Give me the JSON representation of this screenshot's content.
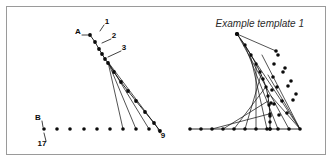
{
  "figure": {
    "background_color": "#ffffff",
    "ink_color": "#0b0b0b",
    "frame_color": "#9a9a9a",
    "width": 332,
    "height": 163
  },
  "caption": {
    "text": "Example template 1",
    "style": "italic"
  },
  "left_panel": {
    "title": "",
    "labels": [
      {
        "id": "A",
        "text": "A",
        "x": 78,
        "y": 32,
        "leader_to_x": 90,
        "leader_to_y": 35
      },
      {
        "id": "1",
        "text": "1",
        "x": 107,
        "y": 22,
        "leader_to_x": 100,
        "leader_to_y": 31
      },
      {
        "id": "2",
        "text": "2",
        "x": 114,
        "y": 36,
        "leader_to_x": 102,
        "leader_to_y": 43
      },
      {
        "id": "3",
        "text": "3",
        "x": 124,
        "y": 48,
        "leader_to_x": 108,
        "leader_to_y": 57
      },
      {
        "id": "9",
        "text": "9",
        "x": 163,
        "y": 136,
        "leader_to_x": 158,
        "leader_to_y": 130
      },
      {
        "id": "B",
        "text": "B",
        "x": 38,
        "y": 118,
        "leader_to_x": 43,
        "leader_to_y": 127
      },
      {
        "id": "17",
        "text": "17",
        "x": 42,
        "y": 144,
        "leader_to_x": 44,
        "leader_to_y": 133
      }
    ],
    "spine_points": [
      {
        "x": 90,
        "y": 35
      },
      {
        "x": 95,
        "y": 42
      },
      {
        "x": 99,
        "y": 49
      },
      {
        "x": 102,
        "y": 54
      },
      {
        "x": 105,
        "y": 59
      },
      {
        "x": 108,
        "y": 63
      },
      {
        "x": 114,
        "y": 72
      },
      {
        "x": 121,
        "y": 82
      },
      {
        "x": 128,
        "y": 91
      },
      {
        "x": 136,
        "y": 101
      },
      {
        "x": 145,
        "y": 112
      },
      {
        "x": 154,
        "y": 123
      },
      {
        "x": 160,
        "y": 131
      }
    ],
    "baseline_points": [
      {
        "x": 44,
        "y": 129
      },
      {
        "x": 57,
        "y": 129
      },
      {
        "x": 70,
        "y": 129
      },
      {
        "x": 84,
        "y": 129
      },
      {
        "x": 97,
        "y": 129
      },
      {
        "x": 110,
        "y": 129
      },
      {
        "x": 123,
        "y": 129
      },
      {
        "x": 136,
        "y": 129
      },
      {
        "x": 149,
        "y": 129
      }
    ],
    "fan_lines": [
      {
        "from_x": 108,
        "from_y": 62,
        "to_x": 123,
        "to_y": 129
      },
      {
        "from_x": 108,
        "from_y": 62,
        "to_x": 136,
        "to_y": 129
      },
      {
        "from_x": 108,
        "from_y": 62,
        "to_x": 149,
        "to_y": 129
      },
      {
        "from_x": 108,
        "from_y": 62,
        "to_x": 160,
        "to_y": 131
      }
    ]
  },
  "right_panel": {
    "apex": {
      "x": 237,
      "y": 34
    },
    "origin": {
      "x": 190,
      "y": 129
    },
    "curve_points": [
      {
        "x": 237,
        "y": 34
      },
      {
        "x": 245,
        "y": 45
      },
      {
        "x": 251,
        "y": 55
      },
      {
        "x": 256,
        "y": 64
      },
      {
        "x": 260,
        "y": 72
      },
      {
        "x": 263,
        "y": 79
      },
      {
        "x": 266,
        "y": 87
      },
      {
        "x": 268,
        "y": 96
      },
      {
        "x": 269,
        "y": 105
      },
      {
        "x": 270,
        "y": 114
      },
      {
        "x": 270,
        "y": 122
      },
      {
        "x": 270,
        "y": 129
      }
    ],
    "vertical_axis_points": [
      {
        "x": 270,
        "y": 129
      },
      {
        "x": 270,
        "y": 116
      },
      {
        "x": 271,
        "y": 103
      },
      {
        "x": 272,
        "y": 90
      },
      {
        "x": 273,
        "y": 77
      },
      {
        "x": 274,
        "y": 64
      },
      {
        "x": 276,
        "y": 51
      },
      {
        "x": 237,
        "y": 34
      }
    ],
    "baseline_points": [
      {
        "x": 190,
        "y": 129
      },
      {
        "x": 201,
        "y": 129
      },
      {
        "x": 212,
        "y": 129
      },
      {
        "x": 223,
        "y": 129
      },
      {
        "x": 234,
        "y": 129
      },
      {
        "x": 245,
        "y": 129
      },
      {
        "x": 256,
        "y": 129
      },
      {
        "x": 267,
        "y": 129
      },
      {
        "x": 278,
        "y": 129
      },
      {
        "x": 289,
        "y": 129
      },
      {
        "x": 300,
        "y": 129
      }
    ],
    "envelope_lines": [
      {
        "from_x": 237,
        "from_y": 34,
        "to_x": 300,
        "to_y": 129
      },
      {
        "from_x": 240,
        "from_y": 39,
        "to_x": 289,
        "to_y": 129
      },
      {
        "from_x": 245,
        "from_y": 46,
        "to_x": 278,
        "to_y": 129
      },
      {
        "from_x": 250,
        "from_y": 54,
        "to_x": 267,
        "to_y": 129
      },
      {
        "from_x": 256,
        "from_y": 64,
        "to_x": 256,
        "to_y": 129
      },
      {
        "from_x": 261,
        "from_y": 75,
        "to_x": 245,
        "to_y": 129
      },
      {
        "from_x": 265,
        "from_y": 88,
        "to_x": 234,
        "to_y": 129
      },
      {
        "from_x": 268,
        "from_y": 101,
        "to_x": 223,
        "to_y": 129
      },
      {
        "from_x": 269,
        "from_y": 114,
        "to_x": 212,
        "to_y": 129
      }
    ],
    "cross_lines": [
      {
        "from_x": 262,
        "from_y": 55,
        "to_x": 300,
        "to_y": 129
      },
      {
        "from_x": 268,
        "from_y": 75,
        "to_x": 300,
        "to_y": 129
      },
      {
        "from_x": 271,
        "from_y": 96,
        "to_x": 300,
        "to_y": 129
      }
    ],
    "grid_nodes": [
      {
        "x": 278,
        "y": 55
      },
      {
        "x": 285,
        "y": 68
      },
      {
        "x": 291,
        "y": 81
      },
      {
        "x": 296,
        "y": 94
      },
      {
        "x": 283,
        "y": 72
      },
      {
        "x": 288,
        "y": 86
      },
      {
        "x": 293,
        "y": 100
      },
      {
        "x": 277,
        "y": 87
      },
      {
        "x": 282,
        "y": 101
      },
      {
        "x": 287,
        "y": 113
      },
      {
        "x": 274,
        "y": 104
      },
      {
        "x": 279,
        "y": 115
      }
    ]
  }
}
